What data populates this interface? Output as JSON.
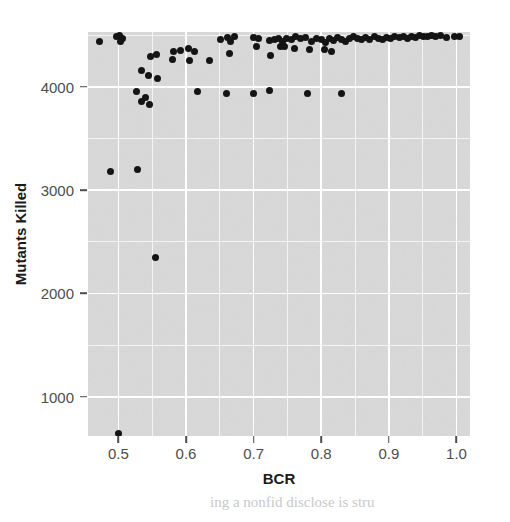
{
  "chart_data": {
    "type": "scatter",
    "title": "",
    "xlabel": "BCR",
    "ylabel": "Mutants Killed",
    "xlim": [
      0.455,
      1.02
    ],
    "ylim": [
      620,
      4530
    ],
    "xticks": [
      0.5,
      0.6,
      0.7,
      0.8,
      0.9,
      1.0
    ],
    "xtick_labels": [
      "0.5",
      "0.6",
      "0.7",
      "0.8",
      "0.9",
      "1.0"
    ],
    "yticks": [
      1000,
      2000,
      3000,
      4000
    ],
    "ytick_labels": [
      "1000",
      "2000",
      "3000",
      "4000"
    ],
    "grid": true,
    "grid_minor": true,
    "legend": "none",
    "panel_background": "#d9d9d9",
    "gridline_color": "#ffffff",
    "point_color": "#141414",
    "point_size": 7,
    "points": [
      [
        0.472,
        4435
      ],
      [
        0.497,
        4490
      ],
      [
        0.502,
        4495
      ],
      [
        0.506,
        4470
      ],
      [
        0.503,
        4440
      ],
      [
        0.556,
        4315
      ],
      [
        0.581,
        4345
      ],
      [
        0.592,
        4350
      ],
      [
        0.604,
        4370
      ],
      [
        0.612,
        4345
      ],
      [
        0.605,
        4250
      ],
      [
        0.651,
        4455
      ],
      [
        0.661,
        4480
      ],
      [
        0.666,
        4440
      ],
      [
        0.672,
        4490
      ],
      [
        0.664,
        4325
      ],
      [
        0.7,
        4480
      ],
      [
        0.707,
        4470
      ],
      [
        0.704,
        4390
      ],
      [
        0.724,
        4450
      ],
      [
        0.731,
        4455
      ],
      [
        0.737,
        4470
      ],
      [
        0.742,
        4440
      ],
      [
        0.749,
        4470
      ],
      [
        0.756,
        4455
      ],
      [
        0.762,
        4485
      ],
      [
        0.77,
        4465
      ],
      [
        0.777,
        4475
      ],
      [
        0.786,
        4440
      ],
      [
        0.793,
        4470
      ],
      [
        0.8,
        4460
      ],
      [
        0.806,
        4430
      ],
      [
        0.812,
        4465
      ],
      [
        0.818,
        4445
      ],
      [
        0.824,
        4475
      ],
      [
        0.83,
        4460
      ],
      [
        0.836,
        4440
      ],
      [
        0.842,
        4470
      ],
      [
        0.848,
        4490
      ],
      [
        0.854,
        4470
      ],
      [
        0.86,
        4455
      ],
      [
        0.866,
        4480
      ],
      [
        0.872,
        4460
      ],
      [
        0.879,
        4485
      ],
      [
        0.885,
        4470
      ],
      [
        0.891,
        4455
      ],
      [
        0.897,
        4480
      ],
      [
        0.903,
        4470
      ],
      [
        0.909,
        4490
      ],
      [
        0.915,
        4475
      ],
      [
        0.921,
        4485
      ],
      [
        0.927,
        4470
      ],
      [
        0.933,
        4490
      ],
      [
        0.939,
        4480
      ],
      [
        0.945,
        4495
      ],
      [
        0.951,
        4485
      ],
      [
        0.957,
        4490
      ],
      [
        0.963,
        4495
      ],
      [
        0.969,
        4490
      ],
      [
        0.976,
        4495
      ],
      [
        0.985,
        4480
      ],
      [
        0.997,
        4490
      ],
      [
        1.004,
        4485
      ],
      [
        0.739,
        4390
      ],
      [
        0.746,
        4385
      ],
      [
        0.76,
        4375
      ],
      [
        0.782,
        4360
      ],
      [
        0.805,
        4360
      ],
      [
        0.815,
        4345
      ],
      [
        0.725,
        4300
      ],
      [
        0.548,
        4290
      ],
      [
        0.534,
        4160
      ],
      [
        0.545,
        4110
      ],
      [
        0.558,
        4080
      ],
      [
        0.58,
        4260
      ],
      [
        0.635,
        4250
      ],
      [
        0.527,
        3950
      ],
      [
        0.54,
        3900
      ],
      [
        0.534,
        3855
      ],
      [
        0.546,
        3830
      ],
      [
        0.617,
        3950
      ],
      [
        0.66,
        3930
      ],
      [
        0.7,
        3930
      ],
      [
        0.724,
        3960
      ],
      [
        0.78,
        3930
      ],
      [
        0.83,
        3930
      ],
      [
        0.488,
        3180
      ],
      [
        0.528,
        3200
      ],
      [
        0.555,
        2345
      ],
      [
        0.5,
        640
      ]
    ]
  },
  "artifacts": {
    "bottom_text": "ing a nonfid disclose is stru"
  }
}
